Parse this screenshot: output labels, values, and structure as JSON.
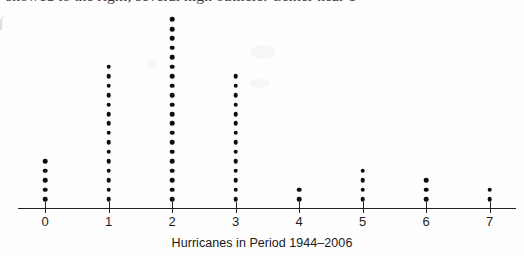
{
  "figure": {
    "kind": "dot-plot",
    "clipped_body_text": "showed to the right; several high outliers. Center near 1",
    "ink_color": "#0d0d0d",
    "axis_color": "#222222"
  },
  "axis": {
    "title": "Hurricanes in Period 1944–2006",
    "tick_labels": [
      "0",
      "1",
      "2",
      "3",
      "4",
      "5",
      "6",
      "7"
    ]
  },
  "chart_data": {
    "type": "scatter",
    "title": "",
    "subtitle": "",
    "xlabel": "Hurricanes in Period 1944–2006",
    "ylabel": "",
    "categories": [
      0,
      1,
      2,
      3,
      4,
      5,
      6,
      7
    ],
    "values": [
      5,
      15,
      20,
      14,
      2,
      4,
      3,
      2
    ],
    "counts": [
      {
        "x": 0,
        "count": 5
      },
      {
        "x": 1,
        "count": 15
      },
      {
        "x": 2,
        "count": 20
      },
      {
        "x": 3,
        "count": 14
      },
      {
        "x": 4,
        "count": 2
      },
      {
        "x": 5,
        "count": 4
      },
      {
        "x": 6,
        "count": 3
      },
      {
        "x": 7,
        "count": 2
      }
    ],
    "total_observations": 65,
    "xlim": [
      -0.5,
      7.5
    ],
    "ylim": [
      0,
      20
    ],
    "grid": false,
    "legend": null
  },
  "geometry": {
    "baseline_y": 208,
    "first_tick_x": 45,
    "tick_spacing": 63.5,
    "dot_spacing_y": 9.45,
    "first_dot_offset_y": 9,
    "tick_height": 11,
    "axis_left_x": 18,
    "axis_right_x": 516,
    "tick_label_y": 215,
    "axis_title_y": 236
  }
}
